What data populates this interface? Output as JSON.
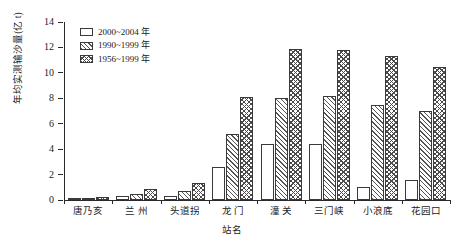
{
  "chart_data": {
    "type": "bar",
    "title": "",
    "subtitle": "",
    "xlabel": "站名",
    "ylabel": "年均实测输沙量(亿 t)",
    "ylim": [
      0,
      14
    ],
    "yticks": [
      0,
      2,
      4,
      6,
      8,
      10,
      12,
      14
    ],
    "ytick_labels": [
      "0",
      "2",
      "4",
      "6",
      "8",
      "10",
      "12",
      "14"
    ],
    "grid": false,
    "legend_position": "upper-left-inside",
    "categories": [
      "唐乃亥",
      "兰 州",
      "头道拐",
      "龙 门",
      "潼 关",
      "三门峡",
      "小浪底",
      "花园口"
    ],
    "series": [
      {
        "name": "2000~2004 年",
        "pattern": "solid-white",
        "values": [
          0.1,
          0.3,
          0.3,
          2.6,
          4.4,
          4.4,
          1.0,
          1.6
        ]
      },
      {
        "name": "1990~1999 年",
        "pattern": "diagonal-hatch",
        "values": [
          0.15,
          0.5,
          0.7,
          5.2,
          8.0,
          8.2,
          7.5,
          7.0
        ]
      },
      {
        "name": "1956~1999 年",
        "pattern": "cross-hatch",
        "values": [
          0.2,
          0.9,
          1.3,
          8.1,
          11.9,
          11.8,
          11.3,
          10.5
        ]
      }
    ],
    "colors": {
      "axis": "#2a2a2a",
      "bar_edge": "#3a3a3a",
      "bar_fill": "#ffffff",
      "hatch": "#4a4a4a",
      "text": "#1a1a1a",
      "background": "#ffffff"
    }
  }
}
